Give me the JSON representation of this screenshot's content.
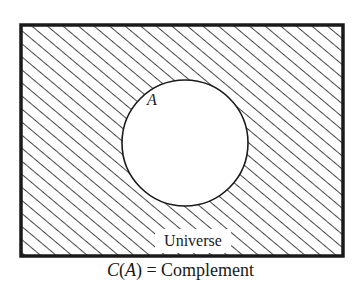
{
  "diagram": {
    "type": "venn-diagram",
    "universe": {
      "label": "Universe",
      "shading": "diagonal-hatch"
    },
    "set": {
      "label": "A",
      "shading": "none"
    },
    "caption": {
      "func": "C",
      "open_paren": "(",
      "arg": "A",
      "close_paren": ")",
      "equals": " = ",
      "text": "Complement"
    },
    "colors": {
      "stroke": "#1a1a1a",
      "background": "#ffffff"
    }
  }
}
